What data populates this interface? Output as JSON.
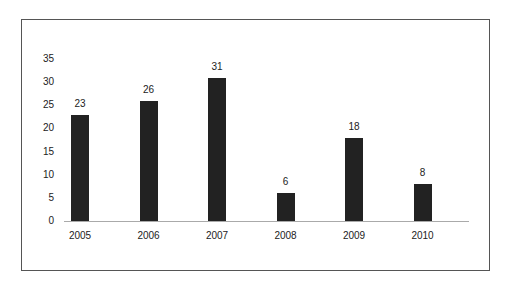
{
  "chart_data": {
    "type": "bar",
    "title": "",
    "xlabel": "",
    "ylabel": "",
    "categories": [
      "2005",
      "2006",
      "2007",
      "2008",
      "2009",
      "2010"
    ],
    "values": [
      23,
      26,
      31,
      6,
      18,
      8
    ],
    "data_labels": [
      "23",
      "26",
      "31",
      "6",
      "18",
      "8"
    ],
    "yticks": [
      "0",
      "5",
      "10",
      "15",
      "20",
      "25",
      "30",
      "35"
    ],
    "ylim": [
      0,
      35
    ],
    "grid": false,
    "legend": null,
    "bar_color": "#222222"
  }
}
